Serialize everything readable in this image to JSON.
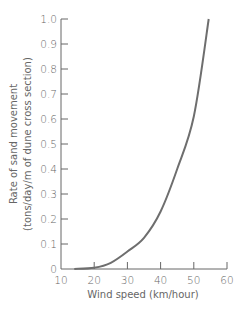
{
  "chart_data": {
    "type": "line",
    "title": "",
    "xlabel": "Wind speed (km/hour)",
    "ylabel": [
      "Rate of sand movement",
      "(tons/day/m of dune cross section)"
    ],
    "xlim": [
      10,
      60
    ],
    "ylim": [
      0,
      1.0
    ],
    "x_ticks": [
      "10",
      "20",
      "30",
      "40",
      "50",
      "60"
    ],
    "y_ticks": [
      "0",
      "0.1",
      "0.2",
      "0.3",
      "0.4",
      "0.5",
      "0.6",
      "0.7",
      "0.8",
      "0.9",
      "1.0"
    ],
    "grid": false,
    "legend": null,
    "series": [
      {
        "name": "Rate of sand movement",
        "color": "#6e6e6e",
        "x": [
          14,
          20,
          25,
          30,
          35,
          40,
          45,
          50,
          54.5
        ],
        "y": [
          0,
          0.005,
          0.025,
          0.07,
          0.125,
          0.23,
          0.4,
          0.61,
          1.0
        ]
      }
    ]
  }
}
